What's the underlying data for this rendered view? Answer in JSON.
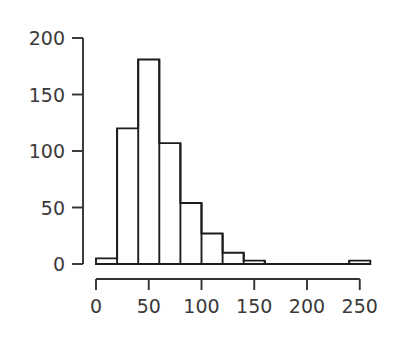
{
  "chart_data": {
    "type": "bar",
    "subtype": "histogram",
    "title": "",
    "subtitle": "",
    "xlabel": "",
    "ylabel": "",
    "xlim": [
      0,
      260
    ],
    "ylim": [
      0,
      200
    ],
    "bin_width": 20,
    "grid": false,
    "legend": null,
    "xticks": [
      0,
      50,
      100,
      150,
      200,
      250
    ],
    "xtick_labels": [
      "0",
      "50",
      "100",
      "150",
      "200",
      "250"
    ],
    "yticks": [
      0,
      50,
      100,
      150,
      200
    ],
    "ytick_labels": [
      "0",
      "50",
      "100",
      "150",
      "200"
    ],
    "bin_edges": [
      0,
      20,
      40,
      60,
      80,
      100,
      120,
      140,
      160,
      180,
      200,
      220,
      240,
      260
    ],
    "categories": [
      "0-20",
      "20-40",
      "40-60",
      "60-80",
      "80-100",
      "100-120",
      "120-140",
      "140-160",
      "160-180",
      "180-200",
      "200-220",
      "220-240",
      "240-260"
    ],
    "values": [
      5,
      120,
      181,
      107,
      54,
      27,
      10,
      3,
      0,
      0,
      0,
      0,
      3
    ],
    "colors": {
      "bar_fill": "#ffffff",
      "bar_stroke": "#1c1c1c",
      "axis": "#333333",
      "text": "#3a3a3a",
      "background": "#ffffff"
    }
  },
  "figure": {
    "width": 399,
    "height": 344
  }
}
